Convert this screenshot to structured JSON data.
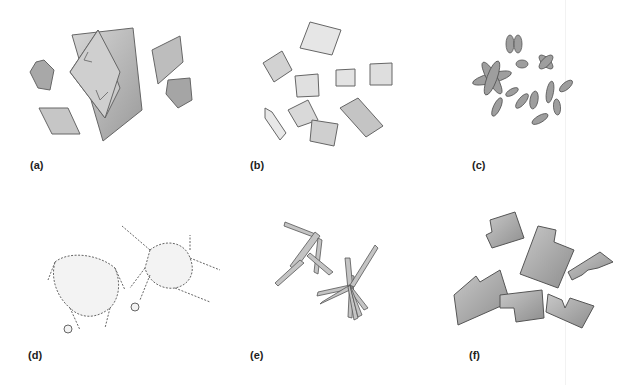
{
  "figure": {
    "panels": [
      {
        "id": "a",
        "label": "(a)",
        "subject": "overlapping rhombic plate crystals and hexagonal grains"
      },
      {
        "id": "b",
        "label": "(b)",
        "subject": "pyramidal / octahedral crystals with faceted faces"
      },
      {
        "id": "c",
        "label": "(c)",
        "subject": "rod-shaped and lobed particles, chromosome-like clusters"
      },
      {
        "id": "d",
        "label": "(d)",
        "subject": "dendritic aggregates with beaded edges"
      },
      {
        "id": "e",
        "label": "(e)",
        "subject": "radiating needle / lath crystal clusters"
      },
      {
        "id": "f",
        "label": "(f)",
        "subject": "blocky L-shaped and stepped plate crystals"
      }
    ]
  },
  "colors": {
    "background": "#ffffff",
    "crystal_fill": "#b8b8b8",
    "crystal_light": "#dcdcdc",
    "crystal_dark": "#8c8c8c",
    "outline": "#555555",
    "label": "#222222"
  }
}
